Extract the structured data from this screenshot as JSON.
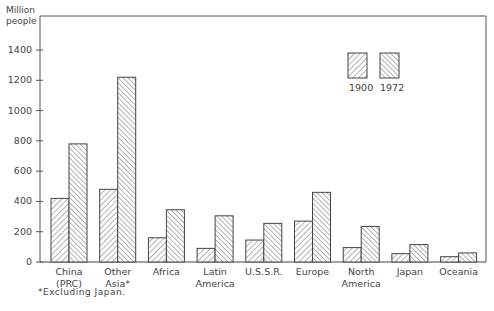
{
  "chart_data": {
    "type": "bar",
    "title": "",
    "ylabel": "Million people",
    "xlabel": "",
    "ylim": [
      0,
      1500
    ],
    "yticks": [
      0,
      200,
      400,
      600,
      800,
      1000,
      1200,
      1400
    ],
    "grid": false,
    "legend_position": "upper right (inside)",
    "categories": [
      "China (PRC)",
      "Other Asia*",
      "Africa",
      "Latin America",
      "U.S.S.R.",
      "Europe",
      "North America",
      "Japan",
      "Oceania"
    ],
    "category_lines": [
      [
        "China",
        "(PRC)"
      ],
      [
        "Other",
        "Asia*"
      ],
      [
        "Africa"
      ],
      [
        "Latin",
        "America"
      ],
      [
        "U.S.S.R."
      ],
      [
        "Europe"
      ],
      [
        "North",
        "America"
      ],
      [
        "Japan"
      ],
      [
        "Oceania"
      ]
    ],
    "series": [
      {
        "name": "1900",
        "pattern": "hatch-forward",
        "values": [
          420,
          480,
          160,
          90,
          145,
          270,
          95,
          55,
          35
        ]
      },
      {
        "name": "1972",
        "pattern": "hatch-backward",
        "values": [
          780,
          1220,
          345,
          305,
          255,
          460,
          235,
          115,
          60
        ]
      }
    ],
    "annotations": [
      "*Excluding Japan."
    ]
  },
  "axis": {
    "ylabel_line1": "Million",
    "ylabel_line2": "people"
  },
  "legend": {
    "items": [
      {
        "label": "1900"
      },
      {
        "label": "1972"
      }
    ]
  },
  "footnote": "*Excluding Japan."
}
